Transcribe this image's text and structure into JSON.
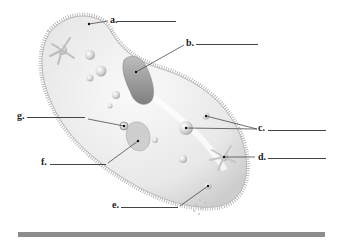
{
  "diagram": {
    "labels": [
      {
        "letter": "a.",
        "x": 110,
        "y": 15,
        "blank_x1": 117,
        "blank_x2": 176,
        "blank_y": 21,
        "targets": [
          [
            89,
            24
          ]
        ],
        "leader_from": [
          108,
          21
        ]
      },
      {
        "letter": "b.",
        "x": 186,
        "y": 38,
        "blank_x1": 196,
        "blank_x2": 258,
        "blank_y": 44,
        "targets": [
          [
            136,
            72
          ]
        ],
        "leader_from": [
          184,
          45
        ]
      },
      {
        "letter": "c.",
        "x": 258,
        "y": 123,
        "blank_x1": 268,
        "blank_x2": 326,
        "blank_y": 130,
        "targets": [
          [
            186,
            128
          ],
          [
            206,
            116
          ]
        ],
        "leader_from": [
          257,
          129
        ]
      },
      {
        "letter": "d.",
        "x": 258,
        "y": 152,
        "blank_x1": 268,
        "blank_x2": 326,
        "blank_y": 158,
        "targets": [
          [
            224,
            157
          ]
        ],
        "leader_from": [
          255,
          157
        ]
      },
      {
        "letter": "e.",
        "x": 112,
        "y": 200,
        "blank_x1": 121,
        "blank_x2": 178,
        "blank_y": 207,
        "targets": [
          [
            208,
            186
          ]
        ],
        "leader_from": [
          180,
          206
        ]
      },
      {
        "letter": "f.",
        "x": 41,
        "y": 157,
        "blank_x1": 50,
        "blank_x2": 106,
        "blank_y": 164,
        "targets": [
          [
            138,
            141
          ]
        ],
        "leader_from": [
          108,
          163
        ]
      },
      {
        "letter": "g.",
        "x": 17,
        "y": 111,
        "blank_x1": 27,
        "blank_x2": 85,
        "blank_y": 117,
        "targets": [
          [
            124,
            126
          ]
        ],
        "leader_from": [
          88,
          119
        ]
      }
    ],
    "colors": {
      "body_fill": "#e9e9e9",
      "body_edge": "#b9b9b9",
      "cilia": "#9a9a9a",
      "organelle": "#cfcfcf",
      "oral_groove": "#8f8f8f",
      "leader": "#333333",
      "bar": "#8c8c8c"
    }
  }
}
